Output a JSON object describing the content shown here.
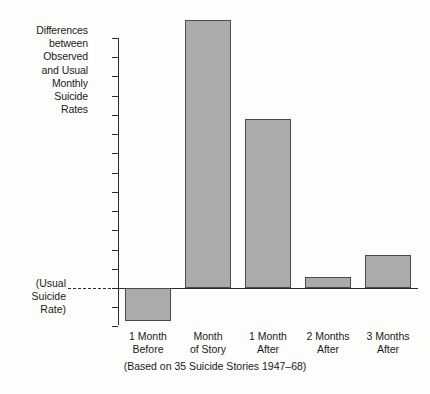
{
  "chart_data": {
    "type": "bar",
    "title": "",
    "ylabel": "Differences between Observed and Usual Monthly Suicide Rates",
    "xlabel": "",
    "caption": "(Based on 35 Suicide Stories 1947–68)",
    "baseline_label": "(Usual Suicide Rate)",
    "categories": [
      "1 Month Before",
      "Month of Story",
      "1 Month After",
      "2 Months After",
      "3 Months After"
    ],
    "category_lines": [
      [
        "1 Month",
        "Before"
      ],
      [
        "Month",
        "of Story"
      ],
      [
        "1 Month",
        "After"
      ],
      [
        "2 Months",
        "After"
      ],
      [
        "3 Months",
        "After"
      ]
    ],
    "values": [
      -170,
      1395,
      880,
      55,
      170
    ],
    "ylim": [
      -200,
      1400
    ],
    "ytick_values": [
      1300,
      1200,
      1100,
      1000,
      900,
      800,
      700,
      600,
      500,
      400,
      300,
      200,
      100,
      0,
      -100,
      -200
    ],
    "ytick_labels": [
      "+1300",
      "+1200",
      "+1100",
      "+1000",
      "+900",
      "+800",
      "+700",
      "+600",
      "+500",
      "+400",
      "+300",
      "+200",
      "+100",
      "0",
      "−100",
      "−200"
    ],
    "grid": false,
    "legend": null,
    "bar_color": "#ababab",
    "bar_edge_color": "#4a4a4a",
    "axis_color": "#2b2b2b",
    "background": "#fdfdfb"
  },
  "axis_title_lines": [
    "Differences",
    "between",
    "Observed",
    "and Usual",
    "Monthly",
    "Suicide",
    "Rates"
  ],
  "usual_note_lines": [
    "(Usual",
    "Suicide",
    "Rate)"
  ]
}
